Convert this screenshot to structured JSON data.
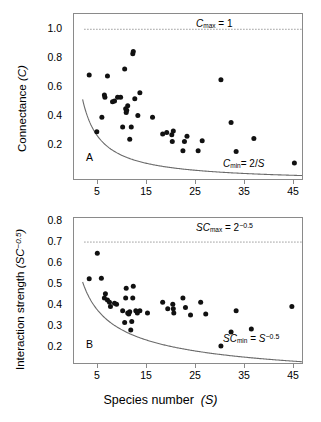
{
  "figure": {
    "xaxis_title_text": "Species number",
    "xaxis_title_symbol": "(S)",
    "xticks": [
      "5",
      "15",
      "25",
      "35",
      "45"
    ]
  },
  "panelA": {
    "letter": "A",
    "ylabel_text": "Connectance",
    "ylabel_symbol": "(C)",
    "yticks": [
      "1.0",
      "0.8",
      "0.6",
      "0.4",
      "0.2"
    ],
    "annotation_max": "Cmax = 1",
    "annotation_min": "Cmin = 2/S"
  },
  "panelB": {
    "letter": "B",
    "ylabel_text": "Interaction strength",
    "ylabel_symbol": "(SC−0.5)",
    "yticks": [
      "0.8",
      "0.7",
      "0.6",
      "0.5",
      "0.4",
      "0.3",
      "0.2"
    ],
    "annotation_max": "SCmax = 2−0.5",
    "annotation_min": "SCmin = S−0.5"
  },
  "chart_data": [
    {
      "type": "scatter",
      "panel": "A",
      "title": "",
      "xlabel": "Species number (S)",
      "ylabel": "Connectance (C)",
      "xlim": [
        2,
        47
      ],
      "ylim": [
        0.02,
        1.1
      ],
      "grid": false,
      "legend": "none",
      "xticks": [
        5,
        15,
        25,
        35,
        45
      ],
      "yticks": [
        0.2,
        0.4,
        0.6,
        0.8,
        1.0
      ],
      "annotations": [
        {
          "text": "Cmax = 1",
          "x": 30,
          "y": 1.05
        },
        {
          "text": "Cmin = 2/S",
          "x": 38,
          "y": 0.1
        }
      ],
      "reference_lines": [
        {
          "name": "C_max",
          "style": "dotted",
          "y": 1.0,
          "x_from": 4,
          "x_to": 47
        },
        {
          "name": "C_min",
          "style": "solid-curve",
          "formula": "2/S",
          "x_from": 3.7,
          "x_to": 47
        }
      ],
      "points": [
        {
          "x": 5.0,
          "y": 0.7
        },
        {
          "x": 6.5,
          "y": 0.33
        },
        {
          "x": 7.5,
          "y": 0.425
        },
        {
          "x": 8.0,
          "y": 0.57
        },
        {
          "x": 8.1,
          "y": 0.555
        },
        {
          "x": 8.6,
          "y": 0.695
        },
        {
          "x": 9.6,
          "y": 0.525
        },
        {
          "x": 10.0,
          "y": 0.53
        },
        {
          "x": 10.6,
          "y": 0.555
        },
        {
          "x": 11.2,
          "y": 0.555
        },
        {
          "x": 11.6,
          "y": 0.36
        },
        {
          "x": 12.0,
          "y": 0.74
        },
        {
          "x": 12.2,
          "y": 0.48
        },
        {
          "x": 12.3,
          "y": 0.455
        },
        {
          "x": 12.4,
          "y": 0.47
        },
        {
          "x": 12.6,
          "y": 0.5
        },
        {
          "x": 13.0,
          "y": 0.28
        },
        {
          "x": 13.3,
          "y": 0.36
        },
        {
          "x": 13.6,
          "y": 0.84
        },
        {
          "x": 13.7,
          "y": 0.855
        },
        {
          "x": 14.0,
          "y": 0.545
        },
        {
          "x": 14.6,
          "y": 0.435
        },
        {
          "x": 15.0,
          "y": 0.585
        },
        {
          "x": 17.5,
          "y": 0.425
        },
        {
          "x": 19.5,
          "y": 0.315
        },
        {
          "x": 20.3,
          "y": 0.325
        },
        {
          "x": 21.3,
          "y": 0.31
        },
        {
          "x": 21.4,
          "y": 0.265
        },
        {
          "x": 21.6,
          "y": 0.335
        },
        {
          "x": 23.5,
          "y": 0.205
        },
        {
          "x": 23.8,
          "y": 0.265
        },
        {
          "x": 24.3,
          "y": 0.3
        },
        {
          "x": 26.5,
          "y": 0.205
        },
        {
          "x": 27.3,
          "y": 0.27
        },
        {
          "x": 31.0,
          "y": 0.67
        },
        {
          "x": 33.0,
          "y": 0.39
        },
        {
          "x": 34.0,
          "y": 0.2
        },
        {
          "x": 37.5,
          "y": 0.285
        },
        {
          "x": 45.5,
          "y": 0.125
        }
      ]
    },
    {
      "type": "scatter",
      "panel": "B",
      "title": "",
      "xlabel": "Species number (S)",
      "ylabel": "Interaction strength (SC^-0.5)",
      "xlim": [
        2,
        47
      ],
      "ylim": [
        0.14,
        0.82
      ],
      "grid": false,
      "legend": "none",
      "xticks": [
        5,
        15,
        25,
        35,
        45
      ],
      "yticks": [
        0.2,
        0.3,
        0.4,
        0.5,
        0.6,
        0.7,
        0.8
      ],
      "annotations": [
        {
          "text": "SCmax = 2^-0.5",
          "x": 30,
          "y": 0.755
        },
        {
          "text": "SCmin = S^-0.5",
          "x": 38,
          "y": 0.215
        }
      ],
      "reference_lines": [
        {
          "name": "SC_max",
          "style": "dotted",
          "y": 0.7071,
          "x_from": 4,
          "x_to": 47
        },
        {
          "name": "SC_min",
          "style": "solid-curve",
          "formula": "S^-0.5",
          "x_from": 3.7,
          "x_to": 47
        }
      ],
      "points": [
        {
          "x": 5.0,
          "y": 0.535
        },
        {
          "x": 6.6,
          "y": 0.655
        },
        {
          "x": 7.4,
          "y": 0.537
        },
        {
          "x": 8.0,
          "y": 0.445
        },
        {
          "x": 8.2,
          "y": 0.465
        },
        {
          "x": 8.6,
          "y": 0.435
        },
        {
          "x": 9.0,
          "y": 0.425
        },
        {
          "x": 9.2,
          "y": 0.405
        },
        {
          "x": 10.0,
          "y": 0.42
        },
        {
          "x": 10.4,
          "y": 0.415
        },
        {
          "x": 11.6,
          "y": 0.385
        },
        {
          "x": 12.0,
          "y": 0.33
        },
        {
          "x": 12.2,
          "y": 0.445
        },
        {
          "x": 12.3,
          "y": 0.49
        },
        {
          "x": 12.6,
          "y": 0.375
        },
        {
          "x": 12.8,
          "y": 0.37
        },
        {
          "x": 13.0,
          "y": 0.38
        },
        {
          "x": 13.2,
          "y": 0.295
        },
        {
          "x": 13.4,
          "y": 0.335
        },
        {
          "x": 13.6,
          "y": 0.445
        },
        {
          "x": 13.7,
          "y": 0.5
        },
        {
          "x": 14.2,
          "y": 0.385
        },
        {
          "x": 14.5,
          "y": 0.375
        },
        {
          "x": 15.0,
          "y": 0.385
        },
        {
          "x": 16.5,
          "y": 0.375
        },
        {
          "x": 19.5,
          "y": 0.425
        },
        {
          "x": 20.5,
          "y": 0.395
        },
        {
          "x": 21.5,
          "y": 0.415
        },
        {
          "x": 21.6,
          "y": 0.395
        },
        {
          "x": 21.7,
          "y": 0.375
        },
        {
          "x": 23.5,
          "y": 0.445
        },
        {
          "x": 24.0,
          "y": 0.4
        },
        {
          "x": 25.0,
          "y": 0.365
        },
        {
          "x": 27.0,
          "y": 0.425
        },
        {
          "x": 28.0,
          "y": 0.37
        },
        {
          "x": 31.0,
          "y": 0.22
        },
        {
          "x": 33.0,
          "y": 0.285
        },
        {
          "x": 34.0,
          "y": 0.385
        },
        {
          "x": 37.0,
          "y": 0.3
        },
        {
          "x": 45.0,
          "y": 0.405
        }
      ]
    }
  ]
}
